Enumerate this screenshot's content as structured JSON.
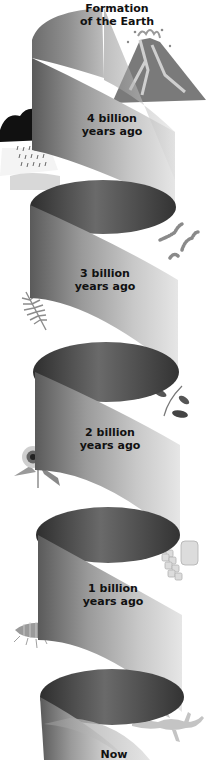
{
  "diagram": {
    "type": "spiral-timeline",
    "colors": {
      "ribbon_light": "#d4d4d4",
      "ribbon_mid": "#a8a8a8",
      "ribbon_dark": "#505050",
      "inner_dark": "#3a3a3a",
      "label_text": "#111111",
      "background": "#ffffff"
    },
    "stages": [
      {
        "id": "formation",
        "line1": "Formation",
        "line2": "of the Earth",
        "illustration": "volcano-icon"
      },
      {
        "id": "4bya",
        "line1": "4 billion",
        "line2": "years ago",
        "illustration": "storm-cloud-icon"
      },
      {
        "id": "3bya",
        "line1": "3 billion",
        "line2": "years ago",
        "illustration": "bacteria-chain-icon"
      },
      {
        "id": "2bya",
        "line1": "2 billion",
        "line2": "years ago",
        "illustration": "plant-sprig-icon"
      },
      {
        "id": "1bya",
        "line1": "1 billion",
        "line2": "years ago",
        "illustration": "cells-icon"
      },
      {
        "id": "now",
        "line1": "Now",
        "line2": "",
        "illustration": "lizard-icon"
      }
    ],
    "side_illustrations": [
      "volcano-icon",
      "storm-cloud-icon",
      "bacteria-chain-icon",
      "fern-icon",
      "plant-sprig-icon",
      "flower-icon",
      "cells-icon",
      "trilobite-icon",
      "lizard-icon"
    ]
  }
}
